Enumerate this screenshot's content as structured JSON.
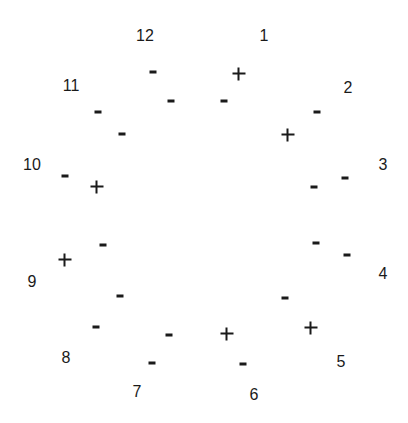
{
  "diagram": {
    "type": "clock-face-markers",
    "background": "#ffffff",
    "ink_color": "#1a1a1a",
    "numbers": [
      {
        "label": "12",
        "x": 145,
        "y": 36
      },
      {
        "label": "1",
        "x": 264,
        "y": 36
      },
      {
        "label": "2",
        "x": 348,
        "y": 88
      },
      {
        "label": "3",
        "x": 383,
        "y": 165
      },
      {
        "label": "4",
        "x": 383,
        "y": 274
      },
      {
        "label": "5",
        "x": 341,
        "y": 362
      },
      {
        "label": "6",
        "x": 254,
        "y": 395
      },
      {
        "label": "7",
        "x": 137,
        "y": 392
      },
      {
        "label": "8",
        "x": 66,
        "y": 358
      },
      {
        "label": "9",
        "x": 32,
        "y": 282
      },
      {
        "label": "10",
        "x": 32,
        "y": 165
      },
      {
        "label": "11",
        "x": 71,
        "y": 86
      }
    ],
    "markers": [
      {
        "sign": "-",
        "x": 153,
        "y": 72
      },
      {
        "sign": "+",
        "x": 239,
        "y": 74
      },
      {
        "sign": "-",
        "x": 171,
        "y": 101
      },
      {
        "sign": "-",
        "x": 224,
        "y": 101
      },
      {
        "sign": "-",
        "x": 317,
        "y": 112
      },
      {
        "sign": "-",
        "x": 98,
        "y": 112
      },
      {
        "sign": "-",
        "x": 122,
        "y": 134
      },
      {
        "sign": "+",
        "x": 288,
        "y": 135
      },
      {
        "sign": "-",
        "x": 65,
        "y": 176
      },
      {
        "sign": "+",
        "x": 97,
        "y": 187
      },
      {
        "sign": "-",
        "x": 345,
        "y": 178
      },
      {
        "sign": "-",
        "x": 314,
        "y": 187
      },
      {
        "sign": "-",
        "x": 103,
        "y": 245
      },
      {
        "sign": "-",
        "x": 316,
        "y": 243
      },
      {
        "sign": "-",
        "x": 347,
        "y": 255
      },
      {
        "sign": "+",
        "x": 65,
        "y": 260
      },
      {
        "sign": "-",
        "x": 120,
        "y": 296
      },
      {
        "sign": "-",
        "x": 285,
        "y": 298
      },
      {
        "sign": "-",
        "x": 96,
        "y": 327
      },
      {
        "sign": "+",
        "x": 311,
        "y": 328
      },
      {
        "sign": "-",
        "x": 169,
        "y": 335
      },
      {
        "sign": "+",
        "x": 227,
        "y": 334
      },
      {
        "sign": "-",
        "x": 152,
        "y": 363
      },
      {
        "sign": "-",
        "x": 243,
        "y": 364
      }
    ]
  }
}
